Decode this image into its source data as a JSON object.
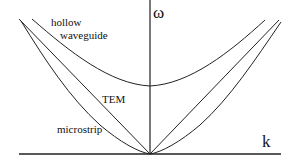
{
  "diagram": {
    "type": "dispersion-relation",
    "axes": {
      "vertical_label": "ω",
      "horizontal_label": "k"
    },
    "curves": [
      {
        "name": "hollow waveguide",
        "label_line1": "hollow",
        "label_line2": "waveguide"
      },
      {
        "name": "TEM",
        "label": "TEM"
      },
      {
        "name": "microstrip",
        "label": "microstrip"
      }
    ],
    "colors": {
      "line": "#222222",
      "background": "#ffffff"
    }
  }
}
